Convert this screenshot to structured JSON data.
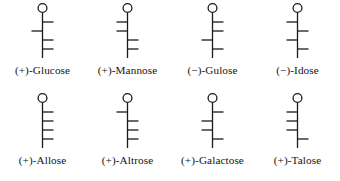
{
  "figure": {
    "background_color": "#ffffff",
    "stroke_color": "#1a1a1a",
    "structure_type": "fischer-projection",
    "geometry": {
      "backbone_top_y": 13,
      "backbone_bottom_y": 58,
      "carbonyl_circle_cy": 8,
      "carbonyl_circle_r": 4.4,
      "tick_ys": [
        22,
        31,
        40,
        49
      ],
      "tick_length": 11,
      "stroke_width": 1.3
    },
    "rows": [
      {
        "row_name": "top-row",
        "cells": [
          {
            "name": "glucose",
            "label": "(+)-Glucose",
            "rotation_sign": "+",
            "sugar_name": "Glucose",
            "oh_sides": [
              "right",
              "left",
              "right",
              "right"
            ]
          },
          {
            "name": "mannose",
            "label": "(+)-Mannose",
            "rotation_sign": "+",
            "sugar_name": "Mannose",
            "oh_sides": [
              "left",
              "left",
              "right",
              "right"
            ]
          },
          {
            "name": "gulose",
            "label": "(−)-Gulose",
            "rotation_sign": "−",
            "sugar_name": "Gulose",
            "oh_sides": [
              "right",
              "right",
              "left",
              "right"
            ]
          },
          {
            "name": "idose",
            "label": "(−)-Idose",
            "rotation_sign": "−",
            "sugar_name": "Idose",
            "oh_sides": [
              "left",
              "right",
              "left",
              "right"
            ]
          }
        ]
      },
      {
        "row_name": "bottom-row",
        "cells": [
          {
            "name": "allose",
            "label": "(+)-Allose",
            "rotation_sign": "+",
            "sugar_name": "Allose",
            "oh_sides": [
              "right",
              "right",
              "right",
              "right"
            ]
          },
          {
            "name": "altrose",
            "label": "(+)-Altrose",
            "rotation_sign": "+",
            "sugar_name": "Altrose",
            "oh_sides": [
              "left",
              "right",
              "right",
              "right"
            ]
          },
          {
            "name": "galactose",
            "label": "(+)-Galactose",
            "rotation_sign": "+",
            "sugar_name": "Galactose",
            "oh_sides": [
              "right",
              "left",
              "left",
              "right"
            ]
          },
          {
            "name": "talose",
            "label": "(+)-Talose",
            "rotation_sign": "+",
            "sugar_name": "Talose",
            "oh_sides": [
              "left",
              "left",
              "left",
              "right"
            ]
          }
        ]
      }
    ]
  }
}
